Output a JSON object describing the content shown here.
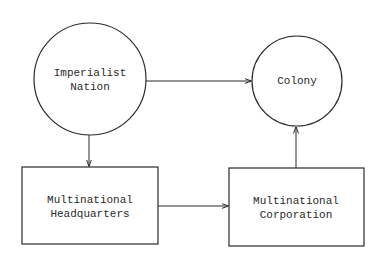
{
  "diagram": {
    "colors": {
      "stroke": "#2a2a2a",
      "background": "#ffffff",
      "text": "#2a2a2a"
    },
    "nodes": {
      "imperialist_nation": {
        "shape": "circle",
        "line1": "Imperialist",
        "line2": "Nation"
      },
      "colony": {
        "shape": "circle",
        "line1": "Colony"
      },
      "multinational_headquarters": {
        "shape": "rectangle",
        "line1": "Multinational",
        "line2": "Headquarters"
      },
      "multinational_corporation": {
        "shape": "rectangle",
        "line1": "Multinational",
        "line2": "Corporation"
      }
    },
    "edges": [
      {
        "from": "Imperialist Nation",
        "to": "Colony"
      },
      {
        "from": "Imperialist Nation",
        "to": "Multinational Headquarters"
      },
      {
        "from": "Multinational Headquarters",
        "to": "Multinational Corporation"
      },
      {
        "from": "Multinational Corporation",
        "to": "Colony"
      }
    ]
  }
}
